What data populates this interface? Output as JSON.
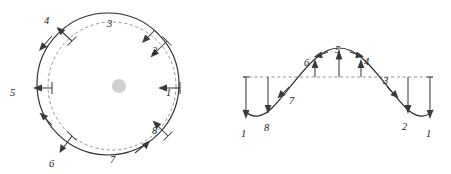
{
  "figure": {
    "background_color": "#ffffff",
    "curve_color": "#2b2b2b",
    "reference_color": "#8c8c8c",
    "arrow_color": "#3a3a3a",
    "center_dot_color": "#d0d0d0"
  },
  "left_panel": {
    "name": "circular-wavefront-diagram",
    "center": {
      "x": 112,
      "y": 86
    },
    "reference_radius": 64,
    "displaced_radius": 72,
    "reference_style": "dashed",
    "displaced_style": "solid",
    "center_dot_radius": 7,
    "points": [
      {
        "id": "1",
        "label": "1",
        "angle_deg": 0,
        "label_x": 168,
        "label_y": 92,
        "arrow": "inward-radial"
      },
      {
        "id": "2",
        "label": "2",
        "angle_deg": 45,
        "label_x": 155,
        "label_y": 50,
        "arrow": "inward-radial"
      },
      {
        "id": "3",
        "label": "3",
        "angle_deg": 90,
        "label_x": 110,
        "label_y": 23,
        "arrow": "none"
      },
      {
        "id": "4",
        "label": "4",
        "angle_deg": 135,
        "label_x": 47,
        "label_y": 20,
        "arrow": "outward-radial"
      },
      {
        "id": "5",
        "label": "5",
        "angle_deg": 180,
        "label_x": 12,
        "label_y": 92,
        "arrow": "outward-radial"
      },
      {
        "id": "6",
        "label": "6",
        "angle_deg": 225,
        "label_x": 52,
        "label_y": 163,
        "arrow": "inward-radial"
      },
      {
        "id": "7",
        "label": "7",
        "angle_deg": 270,
        "label_x": 112,
        "label_y": 160,
        "arrow": "none"
      },
      {
        "id": "8",
        "label": "8",
        "angle_deg": 315,
        "label_x": 155,
        "label_y": 130,
        "arrow": "inward-radial"
      }
    ]
  },
  "right_panel": {
    "name": "sine-wave-displacement-diagram",
    "baseline": {
      "x1": 243,
      "x2": 433,
      "y": 77,
      "style": "dashed"
    },
    "wave": {
      "amplitude": 30,
      "crest_x": 338,
      "crest_y": 50,
      "left_trough_x": 252,
      "right_trough_x": 424,
      "trough_y": 117
    },
    "points": [
      {
        "id": "1-left",
        "label": "1",
        "label_x": 243,
        "label_y": 133,
        "arrow": "down",
        "x": 246,
        "y_from": 77,
        "y_to": 113
      },
      {
        "id": "8",
        "label": "8",
        "label_x": 266,
        "label_y": 127,
        "arrow": "down",
        "x": 268,
        "y_from": 77,
        "y_to": 108
      },
      {
        "id": "7",
        "label": "7",
        "label_x": 291,
        "label_y": 101,
        "arrow": "none"
      },
      {
        "id": "6",
        "label": "6",
        "label_x": 307,
        "label_y": 63,
        "arrow": "up",
        "x": 315,
        "y_from": 77,
        "y_to": 60
      },
      {
        "id": "5",
        "label": "5",
        "label_x": 336,
        "label_y": 53,
        "arrow": "up",
        "x": 338,
        "y_from": 77,
        "y_to": 52
      },
      {
        "id": "4",
        "label": "4",
        "label_x": 364,
        "label_y": 62,
        "arrow": "up",
        "x": 361,
        "y_from": 77,
        "y_to": 60
      },
      {
        "id": "3",
        "label": "3",
        "label_x": 385,
        "label_y": 81,
        "arrow": "none"
      },
      {
        "id": "2",
        "label": "2",
        "label_x": 404,
        "label_y": 126,
        "arrow": "down",
        "x": 408,
        "y_from": 77,
        "y_to": 108
      },
      {
        "id": "1-right",
        "label": "1",
        "label_x": 428,
        "label_y": 133,
        "arrow": "down",
        "x": 430,
        "y_from": 77,
        "y_to": 113
      }
    ]
  }
}
